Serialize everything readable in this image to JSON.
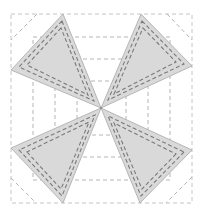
{
  "diagram": {
    "type": "quilt-block-pattern",
    "colors": {
      "background": "#ffffff",
      "triangle_fill": "#d9d9d9",
      "stitch_line": "#7a7a7a",
      "guide_line": "#b5b5b5"
    },
    "outer_square": {
      "x1": 11,
      "y1": 14,
      "x2": 192,
      "y2": 203
    },
    "center": {
      "x": 101,
      "y": 108
    },
    "guide_squares": [
      {
        "x1": 33,
        "y1": 37,
        "x2": 170,
        "y2": 180
      },
      {
        "x1": 55,
        "y1": 59,
        "x2": 148,
        "y2": 157
      },
      {
        "x1": 77,
        "y1": 81,
        "x2": 126,
        "y2": 135
      }
    ],
    "triangles": [
      {
        "name": "top-left",
        "points": [
          [
            63,
            14
          ],
          [
            11,
            70
          ],
          [
            101,
            108
          ]
        ]
      },
      {
        "name": "top-right",
        "points": [
          [
            141,
            14
          ],
          [
            192,
            66
          ],
          [
            101,
            108
          ]
        ]
      },
      {
        "name": "bottom-left",
        "points": [
          [
            11,
            148
          ],
          [
            63,
            203
          ],
          [
            101,
            108
          ]
        ]
      },
      {
        "name": "bottom-right",
        "points": [
          [
            192,
            150
          ],
          [
            140,
            203
          ],
          [
            101,
            108
          ]
        ]
      }
    ]
  }
}
